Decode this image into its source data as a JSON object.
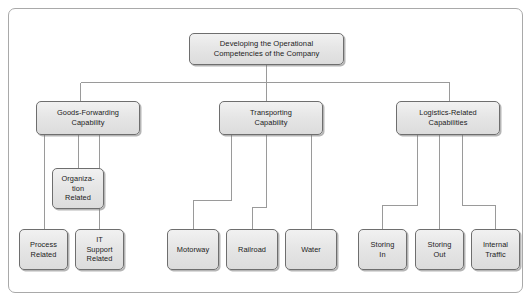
{
  "diagram": {
    "title_node": {
      "id": "root",
      "lines": [
        "Developing the Operational",
        "Competencies of the Company"
      ],
      "text": "Developing the Operational Competencies of the Company"
    },
    "level2": [
      {
        "id": "goods-forwarding-capability",
        "lines": [
          "Goods-Forwarding",
          "Capability"
        ],
        "text": "Goods-Forwarding Capability"
      },
      {
        "id": "transporting-capability",
        "lines": [
          "Transporting",
          "Capability"
        ],
        "text": "Transporting Capability"
      },
      {
        "id": "logistics-related-capabilities",
        "lines": [
          "Logistics-Related",
          "Capabilities"
        ],
        "text": "Logistics-Related Capabilities"
      }
    ],
    "goods_children": [
      {
        "id": "organization-related",
        "lines": [
          "Organiza-",
          "tion",
          "Related"
        ],
        "text": "Organization Related"
      },
      {
        "id": "process-related",
        "lines": [
          "Process",
          "Related"
        ],
        "text": "Process Related"
      },
      {
        "id": "it-support-related",
        "lines": [
          "IT",
          "Support",
          "Related"
        ],
        "text": "IT Support Related"
      }
    ],
    "transport_children": [
      {
        "id": "motorway",
        "lines": [
          "Motorway"
        ],
        "text": "Motorway"
      },
      {
        "id": "railroad",
        "lines": [
          "Railroad"
        ],
        "text": "Railroad"
      },
      {
        "id": "water",
        "lines": [
          "Water"
        ],
        "text": "Water"
      }
    ],
    "logistics_children": [
      {
        "id": "storing-in",
        "lines": [
          "Storing",
          "In"
        ],
        "text": "Storing In"
      },
      {
        "id": "storing-out",
        "lines": [
          "Storing",
          "Out"
        ],
        "text": "Storing Out"
      },
      {
        "id": "internal-traffic",
        "lines": [
          "Internal",
          "Traffic"
        ],
        "text": "Internal Traffic"
      }
    ],
    "colors": {
      "node_fill_top": "#f1f1f1",
      "node_fill_bottom": "#dcdcdc",
      "node_border": "#6e6e6e",
      "connector": "#9a9a9a",
      "frame_border": "#a9a9a9",
      "background": "#ffffff",
      "text": "#1b1b1b"
    }
  }
}
